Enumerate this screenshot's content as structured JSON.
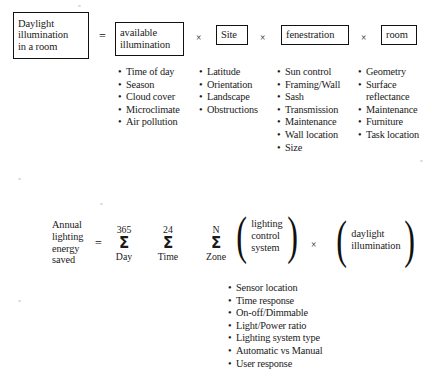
{
  "diagram": {
    "operators": {
      "equals": "=",
      "times": "×",
      "sigma": "Σ",
      "bullet": "•",
      "paren_left": "(",
      "paren_right": ")"
    },
    "equation_top": {
      "result_box": {
        "name": "daylight-illumination-in-a-room",
        "lines": [
          "Daylight",
          "illumination",
          "in a room"
        ]
      },
      "factors": [
        {
          "box": {
            "lines": [
              "available",
              "illumination"
            ]
          },
          "items": [
            "Time of day",
            "Season",
            "Cloud cover",
            "Microclimate",
            "Air pollution"
          ]
        },
        {
          "box": {
            "lines": [
              "Site"
            ]
          },
          "items": [
            "Latitude",
            "Orientation",
            "Landscape",
            "Obstructions"
          ]
        },
        {
          "box": {
            "lines": [
              "fenestration"
            ]
          },
          "items": [
            "Sun control",
            "Framing/Wall",
            "Sash",
            "Transmission",
            "Maintenance",
            "Wall location",
            "Size"
          ]
        },
        {
          "box": {
            "lines": [
              "room"
            ]
          },
          "items": [
            "Geometry",
            "Surface",
            "reflectance",
            "Maintenance",
            "Furniture",
            "Task location"
          ],
          "item_has_bullet": [
            true,
            true,
            false,
            true,
            true,
            true
          ]
        }
      ]
    },
    "equation_bottom": {
      "lhs_lines": [
        "Annual",
        "lighting",
        "energy",
        "saved"
      ],
      "summations": [
        {
          "upper": "365",
          "lower": "Day"
        },
        {
          "upper": "24",
          "lower": "Time"
        },
        {
          "upper": "N",
          "lower": "Zone"
        }
      ],
      "group_lighting_control": {
        "lines": [
          "lighting",
          "control",
          "system"
        ]
      },
      "group_daylight": {
        "lines": [
          "daylight",
          "illumination"
        ]
      },
      "lighting_control_items": [
        "Sensor location",
        "Time response",
        "On-off/Dimmable",
        "Light/Power ratio",
        "Lighting system type",
        "Automatic vs Manual",
        "User response"
      ]
    }
  },
  "colors": {
    "ink": "#1a1a1a",
    "box_border": "#111111",
    "background": "#ffffff"
  }
}
